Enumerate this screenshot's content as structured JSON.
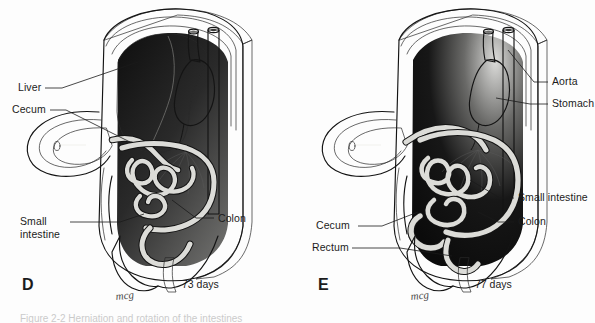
{
  "figure": {
    "kind": "anatomical-illustration",
    "title_caption": "Figure 2-2  Herniation and rotation of the intestines",
    "background_color": "#fdfdfd",
    "ink_color": "#141414",
    "artist_signature": "mcg"
  },
  "panels": [
    {
      "letter": "D",
      "age": "73 days",
      "labels": [
        {
          "id": "liver",
          "text": "Liver"
        },
        {
          "id": "cecum",
          "text": "Cecum"
        },
        {
          "id": "small-intestine",
          "text": "Small\nintestine",
          "line1": "Small",
          "line2": "intestine"
        },
        {
          "id": "colon",
          "text": "Colon"
        }
      ],
      "signature": "mcg"
    },
    {
      "letter": "E",
      "age": "77 days",
      "labels": [
        {
          "id": "aorta",
          "text": "Aorta"
        },
        {
          "id": "stomach",
          "text": "Stomach"
        },
        {
          "id": "small-intestine",
          "text": "Small intestine"
        },
        {
          "id": "colon",
          "text": "Colon"
        },
        {
          "id": "cecum",
          "text": "Cecum"
        },
        {
          "id": "rectum",
          "text": "Rectum"
        }
      ],
      "signature": "mcg"
    }
  ],
  "caption": {
    "text": "Figure 2-2   Herniation and rotation of the intestines"
  }
}
